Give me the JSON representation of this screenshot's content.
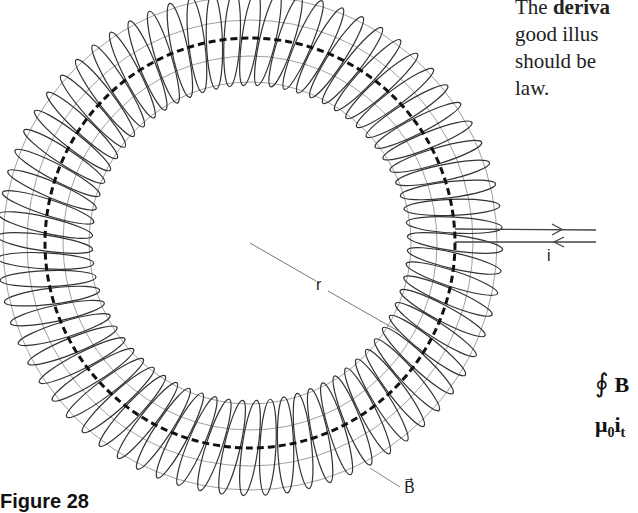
{
  "text": {
    "line1_prefix": "The ",
    "line1_bold": "deriva",
    "line2": "good illus",
    "line3": "should be",
    "line4": "law."
  },
  "equations": {
    "eq1_integral": "∮",
    "eq1_vector": "B⃗",
    "eq2_mu": "μ",
    "eq2_sub": "0",
    "eq2_i": "i",
    "eq2_isub": "t"
  },
  "figure": {
    "caption": "Figure 28",
    "labels": {
      "radius": "r",
      "current": "i",
      "field": "B⃗"
    },
    "geometry": {
      "center_x": 250,
      "center_y": 243,
      "mean_radius": 205,
      "tube_half_width": 48,
      "turns": 72
    },
    "colors": {
      "coil": "#333333",
      "guide": "#888888",
      "dashed": "#111111"
    }
  }
}
